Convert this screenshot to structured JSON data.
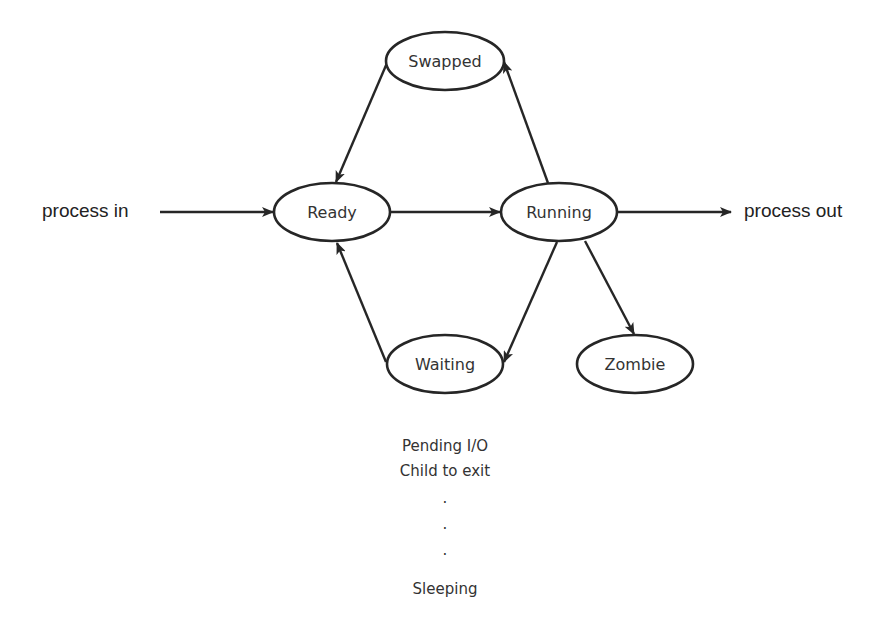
{
  "diagram": {
    "type": "state-transition",
    "colors": {
      "stroke": "#262626",
      "text": "#333333",
      "background": "#ffffff"
    },
    "entry_label": "process in",
    "exit_label": "process out",
    "nodes": [
      {
        "id": "swapped",
        "label": "Swapped"
      },
      {
        "id": "ready",
        "label": "Ready"
      },
      {
        "id": "running",
        "label": "Running"
      },
      {
        "id": "waiting",
        "label": "Waiting"
      },
      {
        "id": "zombie",
        "label": "Zombie"
      }
    ],
    "edges": [
      {
        "from": "process in",
        "to": "ready"
      },
      {
        "from": "ready",
        "to": "running"
      },
      {
        "from": "running",
        "to": "process out"
      },
      {
        "from": "running",
        "to": "swapped"
      },
      {
        "from": "swapped",
        "to": "ready"
      },
      {
        "from": "running",
        "to": "waiting"
      },
      {
        "from": "waiting",
        "to": "ready"
      },
      {
        "from": "running",
        "to": "zombie"
      }
    ],
    "waiting_reasons": {
      "lines": [
        "Pending I/O",
        "Child to exit",
        ".",
        ".",
        ".",
        "Sleeping"
      ]
    }
  }
}
